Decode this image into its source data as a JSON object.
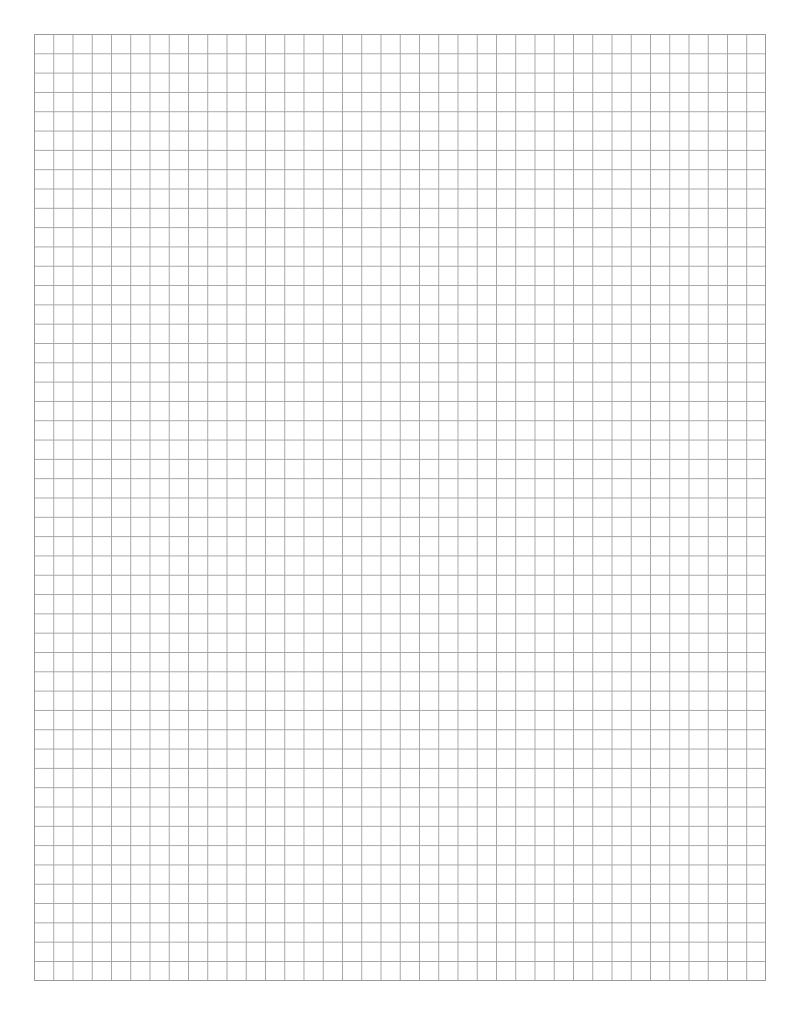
{
  "page": {
    "type": "graph-paper",
    "grid": {
      "columns": 38,
      "rows": 49,
      "line_color": "#a5a5a5",
      "border_color": "#9a9a9a",
      "background": "#ffffff"
    }
  }
}
